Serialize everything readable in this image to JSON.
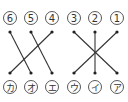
{
  "diagram": {
    "top_labels": [
      "6",
      "5",
      "4",
      "3",
      "2",
      "1"
    ],
    "bottom_labels": [
      "カ",
      "オ",
      "エ",
      "ウ",
      "イ",
      "ア"
    ],
    "connections": [
      {
        "from": "6",
        "to": "オ"
      },
      {
        "from": "5",
        "to": "エ"
      },
      {
        "from": "4",
        "to": "カ"
      },
      {
        "from": "3",
        "to": "ア"
      },
      {
        "from": "2",
        "to": "イ"
      },
      {
        "from": "1",
        "to": "ウ"
      }
    ],
    "colors": {
      "line": "#333333",
      "circle_stroke": "#444444",
      "background": "#ffffff"
    }
  }
}
